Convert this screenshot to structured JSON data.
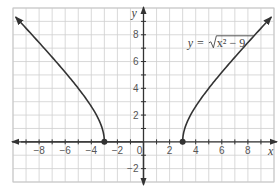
{
  "chart_data": {
    "type": "line",
    "title": "",
    "xlabel": "x",
    "ylabel": "y",
    "xlim": [
      -10,
      10
    ],
    "ylim": [
      -3,
      10
    ],
    "grid": true,
    "x_ticks": [
      -8,
      -6,
      -4,
      -2,
      0,
      2,
      4,
      6,
      8
    ],
    "y_ticks": [
      8,
      6,
      4,
      2,
      -2
    ],
    "x_tick_labels": [
      "−8",
      "−6",
      "−4",
      "−2",
      "0",
      "2",
      "4",
      "6",
      "8"
    ],
    "y_tick_labels": [
      "8",
      "6",
      "4",
      "2",
      "−2"
    ],
    "annotation": {
      "lhs": "y = ",
      "radicand": "x² − 9",
      "text": "y = √(x² − 9)",
      "position": [
        3.4,
        7.1
      ]
    },
    "series": [
      {
        "name": "y = √(x² − 9), left branch",
        "domain": [
          -9.8,
          -3
        ],
        "endpoint": [
          -3,
          0
        ],
        "endpoint_marker": "filled-circle",
        "arrow_end": [
          -9.8,
          9.33
        ],
        "points": [
          [
            -9.8,
            9.33
          ],
          [
            -9,
            8.49
          ],
          [
            -8,
            7.42
          ],
          [
            -7,
            6.32
          ],
          [
            -6,
            5.2
          ],
          [
            -5,
            4.0
          ],
          [
            -4,
            2.65
          ],
          [
            -3.5,
            1.8
          ],
          [
            -3.1,
            0.78
          ],
          [
            -3,
            0
          ]
        ]
      },
      {
        "name": "y = √(x² − 9), right branch",
        "domain": [
          3,
          9.8
        ],
        "endpoint": [
          3,
          0
        ],
        "endpoint_marker": "filled-circle",
        "arrow_end": [
          9.8,
          9.33
        ],
        "points": [
          [
            3,
            0
          ],
          [
            3.1,
            0.78
          ],
          [
            3.5,
            1.8
          ],
          [
            4,
            2.65
          ],
          [
            5,
            4.0
          ],
          [
            6,
            5.2
          ],
          [
            7,
            6.32
          ],
          [
            8,
            7.42
          ],
          [
            9,
            8.49
          ],
          [
            9.8,
            9.33
          ]
        ]
      }
    ],
    "colors": {
      "curve": "#333333",
      "axis": "#333333",
      "grid": "#cfcfcf",
      "border": "#c8c8c8",
      "text": "#555555"
    }
  }
}
